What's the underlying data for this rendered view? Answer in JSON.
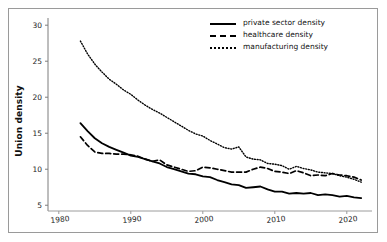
{
  "figure": {
    "title_faint": "",
    "frame_color": "#9a9a9a",
    "background": "#ffffff"
  },
  "axes": {
    "y_label": "Union density",
    "y_ticks": [
      5,
      10,
      15,
      20,
      25,
      30
    ],
    "x_ticks": [
      1980,
      1990,
      2000,
      2010,
      2020
    ],
    "x_range": [
      1978.5,
      2023.5
    ],
    "y_range": [
      4.2,
      31.0
    ]
  },
  "legend": {
    "position": "top-right",
    "entries": [
      {
        "label": "private sector density",
        "style": "solid",
        "color": "#000000"
      },
      {
        "label": "healthcare density",
        "style": "dashed",
        "color": "#000000"
      },
      {
        "label": "manufacturing density",
        "style": "dotted",
        "color": "#000000"
      }
    ]
  },
  "chart_data": {
    "type": "line",
    "title": "",
    "xlabel": "",
    "ylabel": "Union density",
    "xlim": [
      1978.5,
      2023.5
    ],
    "ylim": [
      4.2,
      31.0
    ],
    "grid": false,
    "legend_position": "top-right",
    "x": [
      1983,
      1984,
      1985,
      1986,
      1987,
      1988,
      1989,
      1990,
      1991,
      1992,
      1993,
      1994,
      1995,
      1996,
      1997,
      1998,
      1999,
      2000,
      2001,
      2002,
      2003,
      2004,
      2005,
      2006,
      2007,
      2008,
      2009,
      2010,
      2011,
      2012,
      2013,
      2014,
      2015,
      2016,
      2017,
      2018,
      2019,
      2020,
      2021,
      2022
    ],
    "series": [
      {
        "name": "private sector density",
        "style": "solid",
        "color": "#000000",
        "values": [
          16.4,
          15.3,
          14.3,
          13.6,
          13.1,
          12.7,
          12.3,
          11.9,
          11.7,
          11.4,
          11.1,
          10.8,
          10.3,
          10.0,
          9.7,
          9.4,
          9.3,
          9.0,
          8.9,
          8.5,
          8.2,
          7.9,
          7.8,
          7.4,
          7.5,
          7.6,
          7.2,
          6.9,
          6.9,
          6.6,
          6.7,
          6.6,
          6.7,
          6.4,
          6.5,
          6.4,
          6.2,
          6.3,
          6.1,
          6.0
        ]
      },
      {
        "name": "healthcare density",
        "style": "dashed",
        "color": "#000000",
        "values": [
          14.5,
          13.3,
          12.4,
          12.2,
          12.2,
          12.1,
          12.1,
          12.0,
          11.8,
          11.4,
          11.1,
          11.3,
          10.6,
          10.3,
          10.0,
          9.7,
          9.8,
          10.3,
          10.2,
          10.0,
          9.8,
          9.6,
          9.6,
          9.6,
          10.0,
          10.3,
          10.1,
          9.7,
          9.6,
          9.4,
          9.8,
          9.5,
          9.1,
          9.2,
          9.1,
          9.4,
          9.2,
          9.1,
          8.9,
          8.5
        ]
      },
      {
        "name": "manufacturing density",
        "style": "dotted",
        "color": "#000000",
        "values": [
          27.8,
          26.0,
          24.6,
          23.5,
          22.5,
          21.8,
          21.0,
          20.4,
          19.6,
          18.9,
          18.3,
          17.8,
          17.2,
          16.6,
          16.0,
          15.4,
          14.9,
          14.6,
          14.0,
          13.5,
          13.0,
          12.8,
          13.1,
          11.7,
          11.4,
          11.3,
          10.8,
          10.7,
          10.5,
          10.0,
          10.4,
          10.1,
          9.9,
          9.6,
          9.5,
          9.4,
          9.1,
          8.9,
          8.6,
          8.2
        ]
      }
    ]
  }
}
